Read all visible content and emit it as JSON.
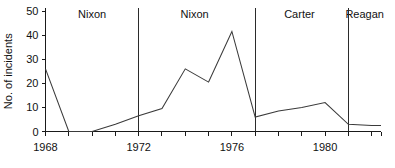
{
  "chart_data": {
    "type": "line",
    "title": "",
    "xlabel": "",
    "ylabel": "No. of incidents",
    "xlim": [
      1968,
      1982.4
    ],
    "ylim": [
      0,
      50
    ],
    "grid": false,
    "legend_position": "none",
    "x": [
      1968,
      1969,
      1970,
      1971,
      1972,
      1973,
      1974,
      1975,
      1976,
      1977,
      1978,
      1979,
      1980,
      1981,
      1982,
      1982.4
    ],
    "values": [
      26,
      0,
      0,
      3,
      6.5,
      9.5,
      26,
      20.5,
      41.5,
      6,
      8.5,
      10,
      12,
      3,
      2.5,
      2.5
    ],
    "series": [
      {
        "name": "No. of incidents",
        "values": [
          26,
          0,
          0,
          3,
          6.5,
          9.5,
          26,
          20.5,
          41.5,
          6,
          8.5,
          10,
          12,
          3,
          2.5,
          2.5
        ]
      }
    ],
    "y_ticks": [
      0,
      10,
      20,
      30,
      40,
      50
    ],
    "y_tick_labels": [
      "0",
      "10",
      "20",
      "30",
      "40",
      "50"
    ],
    "x_ticks": [
      1968,
      1969,
      1970,
      1971,
      1972,
      1973,
      1974,
      1975,
      1976,
      1977,
      1978,
      1979,
      1980,
      1981,
      1982
    ],
    "x_tick_labels": [
      "1968",
      "",
      "",
      "",
      "1972",
      "",
      "",
      "",
      "1976",
      "",
      "",
      "",
      "1980",
      "",
      ""
    ],
    "x_labeled_ticks": [
      {
        "value": 1968,
        "label": "1968"
      },
      {
        "value": 1972,
        "label": "1972"
      },
      {
        "value": 1976,
        "label": "1976"
      },
      {
        "value": 1980,
        "label": "1980"
      }
    ],
    "annotations": [
      {
        "label": "Nixon",
        "x_center": 1970.0,
        "divider_x": null
      },
      {
        "label": "Nixon",
        "x_center": 1974.4,
        "divider_x": 1972.0
      },
      {
        "label": "Carter",
        "x_center": 1978.9,
        "divider_x": 1977.0
      },
      {
        "label": "Reagan",
        "x_center": 1981.7,
        "divider_x": 1981.0
      }
    ],
    "dividers": [
      1972.0,
      1977.0,
      1981.0
    ],
    "colors": {
      "line": "#3a3a3a",
      "axis": "#1a1a1a",
      "divider": "#2b2b2b",
      "text": "#111111",
      "background": "#ffffff"
    }
  }
}
